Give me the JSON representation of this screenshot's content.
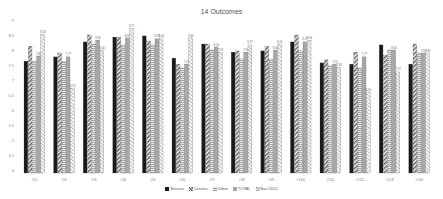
{
  "chart_data": {
    "type": "bar",
    "title": "14 Outcomes",
    "xlabel": "",
    "ylabel": "",
    "ylim": [
      4,
      9
    ],
    "yticks": [
      4,
      4.5,
      5,
      5.5,
      6,
      6.5,
      7,
      7.5,
      8,
      8.5,
      9
    ],
    "grid": false,
    "legend_position": "bottom",
    "categories": [
      "O1",
      "O2",
      "O3",
      "O4",
      "O5",
      "O6",
      "O7",
      "O8",
      "O9",
      "O10",
      "O11",
      "O12",
      "O13",
      "O14"
    ],
    "series": [
      {
        "name": "Brescia",
        "fill": "#1a1a1a",
        "pattern": "solid",
        "values": [
          7.63,
          7.77,
          8.27,
          8.43,
          8.47,
          7.73,
          8.2,
          7.93,
          7.97,
          8.27,
          7.57,
          7.53,
          8.17,
          7.53
        ]
      },
      {
        "name": "Cesena",
        "fill": "#9a9a9a",
        "pattern": "diagonal",
        "values": [
          8.13,
          7.9,
          8.5,
          8.43,
          8.3,
          7.53,
          8.2,
          7.97,
          8.13,
          8.5,
          7.67,
          7.93,
          7.83,
          8.2
        ]
      },
      {
        "name": "Udine",
        "fill": "#c8c8c8",
        "pattern": "horizontal",
        "values": [
          7.63,
          7.63,
          8.2,
          8.17,
          8.17,
          7.4,
          8.0,
          7.7,
          7.7,
          7.97,
          7.47,
          7.4,
          8.0,
          7.9
        ]
      },
      {
        "name": "TOTAL",
        "fill": "#a8a8a8",
        "pattern": "solid-light",
        "values": [
          7.8,
          7.77,
          8.33,
          8.4,
          8.37,
          7.53,
          8.1,
          7.93,
          8.0,
          8.27,
          7.53,
          7.77,
          8.0,
          7.9
        ]
      },
      {
        "name": "Bari 2012",
        "fill": "#e0e0e0",
        "pattern": "dotted-diagonal",
        "values": [
          8.53,
          6.73,
          8.0,
          8.71,
          8.4,
          8.4,
          7.93,
          8.17,
          8.2,
          8.33,
          7.43,
          6.6,
          7.27,
          7.9
        ]
      }
    ],
    "data_labels_series": "TOTAL and Bari 2012 (partially legible)"
  }
}
